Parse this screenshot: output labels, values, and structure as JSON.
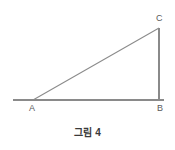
{
  "figure": {
    "caption": "그림 4",
    "background_color": "#ffffff",
    "line_color": "#8a8a8a",
    "label_color": "#5a5a5a",
    "caption_color": "#3a3a3a",
    "width": 175,
    "height": 150
  },
  "vertices": [
    {
      "name": "A",
      "label": "A",
      "x": 33,
      "y": 100
    },
    {
      "name": "B",
      "label": "B",
      "x": 159,
      "y": 100
    },
    {
      "name": "C",
      "label": "C",
      "x": 159,
      "y": 28
    }
  ],
  "segments": [
    {
      "name": "baseline-ray",
      "from_x": 13,
      "from_y": 100,
      "to_x": 164,
      "to_y": 100
    },
    {
      "name": "side-BC",
      "from_x": 159,
      "from_y": 100,
      "to_x": 159,
      "to_y": 28
    },
    {
      "name": "hypotenuse-AC",
      "from_x": 33,
      "from_y": 100,
      "to_x": 159,
      "to_y": 28
    }
  ]
}
